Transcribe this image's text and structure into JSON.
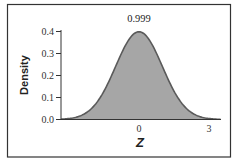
{
  "chart_data": {
    "type": "area",
    "title": "",
    "xlabel": "Z",
    "ylabel": "Density",
    "annotation": "0.999",
    "distribution": "standard normal",
    "shaded_region": {
      "from": -3.35,
      "to": 3.5,
      "fraction": 0.999
    },
    "x_ticks": [
      {
        "value": 0,
        "label": "0"
      },
      {
        "value": 3,
        "label": "3"
      }
    ],
    "y_ticks": [
      {
        "value": 0.0,
        "label": "0.0"
      },
      {
        "value": 0.1,
        "label": "0.1"
      },
      {
        "value": 0.2,
        "label": "0.2"
      },
      {
        "value": 0.3,
        "label": "0.3"
      },
      {
        "value": 0.4,
        "label": "0.4"
      }
    ],
    "xlim": [
      -3.35,
      3.5
    ],
    "ylim": [
      0,
      0.4
    ],
    "grid": false,
    "legend": null,
    "colors": {
      "fill": "#a6a6a6",
      "curve": "#5a5a5a",
      "axis": "#333333",
      "frame": "#333333"
    }
  }
}
